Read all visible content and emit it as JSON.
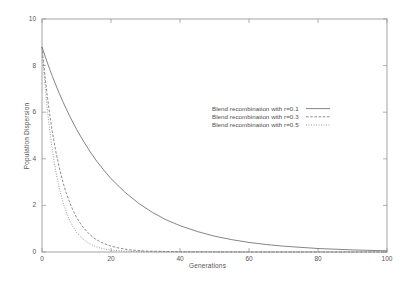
{
  "chart_data": {
    "type": "line",
    "title": "",
    "xlabel": "Generations",
    "ylabel": "Population Dispersion",
    "xlim": [
      0,
      100
    ],
    "ylim": [
      0,
      10
    ],
    "xticks": [
      0,
      20,
      40,
      60,
      80,
      100
    ],
    "yticks": [
      0,
      2,
      4,
      6,
      8,
      10
    ],
    "grid": false,
    "legend_position": "center",
    "background": "#ffffff",
    "frame_color": "#9a9a9a",
    "series": [
      {
        "name": "Blend recombination with r=0.1",
        "style": "solid",
        "color": "#6f6f6f",
        "x": [
          0,
          1,
          2,
          3,
          4,
          5,
          6,
          7,
          8,
          9,
          10,
          12,
          14,
          16,
          18,
          20,
          24,
          28,
          32,
          36,
          40,
          45,
          50,
          55,
          60,
          65,
          70,
          80,
          90,
          100
        ],
        "y": [
          8.8,
          8.36,
          7.94,
          7.54,
          7.17,
          6.81,
          6.47,
          6.15,
          5.84,
          5.55,
          5.27,
          4.76,
          4.29,
          3.87,
          3.5,
          3.15,
          2.57,
          2.09,
          1.7,
          1.38,
          1.13,
          0.88,
          0.68,
          0.53,
          0.41,
          0.32,
          0.25,
          0.15,
          0.09,
          0.05
        ]
      },
      {
        "name": "Blend recombination with r=0.3",
        "style": "dashed",
        "color": "#7a7a7a",
        "x": [
          0,
          0.5,
          1,
          1.5,
          2,
          2.5,
          3,
          3.5,
          4,
          5,
          6,
          7,
          8,
          9,
          10,
          11,
          12,
          13,
          14,
          15,
          16,
          17,
          18,
          20,
          22,
          25,
          30,
          40,
          60,
          80,
          100
        ],
        "y": [
          8.8,
          8.05,
          7.37,
          6.74,
          6.17,
          5.64,
          5.16,
          4.73,
          4.32,
          3.62,
          3.03,
          2.54,
          2.13,
          1.78,
          1.49,
          1.25,
          1.05,
          0.88,
          0.73,
          0.61,
          0.51,
          0.43,
          0.36,
          0.25,
          0.18,
          0.1,
          0.04,
          0.01,
          0.0,
          0.0,
          0.0
        ]
      },
      {
        "name": "Blend recombination with r=0.5",
        "style": "dotted",
        "color": "#8a8a8a",
        "x": [
          0,
          0.5,
          1,
          1.5,
          2,
          2.5,
          3,
          3.5,
          4,
          5,
          6,
          7,
          8,
          9,
          10,
          11,
          12,
          13,
          14,
          15,
          16,
          18,
          20,
          25,
          30,
          40,
          60,
          80,
          100
        ],
        "y": [
          8.8,
          7.83,
          6.97,
          6.2,
          5.52,
          4.91,
          4.37,
          3.89,
          3.46,
          2.74,
          2.17,
          1.72,
          1.36,
          1.08,
          0.85,
          0.68,
          0.54,
          0.43,
          0.34,
          0.27,
          0.21,
          0.13,
          0.08,
          0.03,
          0.01,
          0.0,
          0.0,
          0.0,
          0.0
        ]
      }
    ]
  },
  "axes": {
    "x_title": "Generations",
    "y_title": "Population Dispersion",
    "x_tick_labels": [
      "0",
      "20",
      "40",
      "60",
      "80",
      "100"
    ],
    "y_tick_labels": [
      "0",
      "2",
      "4",
      "6",
      "8",
      "10"
    ]
  },
  "legend": {
    "entries": [
      {
        "label": "Blend recombination with r=0.1",
        "style": "solid"
      },
      {
        "label": "Blend recombination with r=0.3",
        "style": "dashed"
      },
      {
        "label": "Blend recombination with r=0.5",
        "style": "dotted"
      }
    ]
  }
}
